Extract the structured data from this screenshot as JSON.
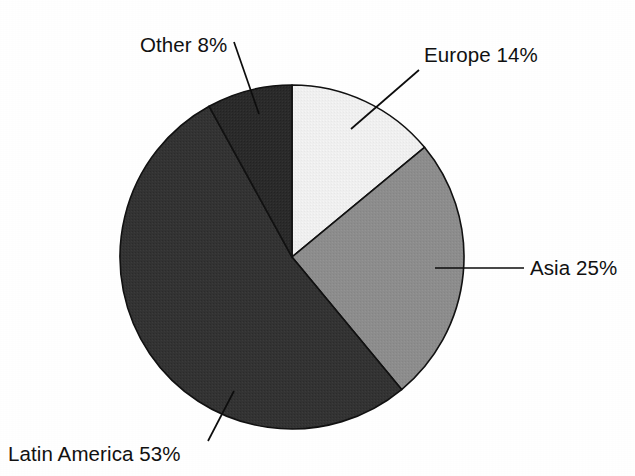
{
  "chart_data": {
    "type": "pie",
    "title": "",
    "subtitle": "",
    "xlabel": "",
    "ylabel": "",
    "legend_position": "none",
    "labels_position": "outside-with-leader-lines",
    "grid": false,
    "background_color": "#ffffff",
    "start_angle_deg": 0,
    "direction": "clockwise",
    "categories": [
      "Europe",
      "Asia",
      "Latin America",
      "Other"
    ],
    "values": [
      14,
      25,
      53,
      8
    ],
    "unit": "%",
    "slices": [
      {
        "name": "Europe",
        "value": 14,
        "label": "Europe 14%",
        "color": "#f0f0f0",
        "start_deg": 0,
        "end_deg": 50.4,
        "label_x": 424,
        "label_y": 62,
        "label_anchor": "start",
        "leader": {
          "x1": 351,
          "y1": 129,
          "x2": 419,
          "y2": 70
        }
      },
      {
        "name": "Asia",
        "value": 25,
        "label": "Asia 25%",
        "color": "#8d8d8d",
        "start_deg": 50.4,
        "end_deg": 140.4,
        "label_x": 530,
        "label_y": 275,
        "label_anchor": "start",
        "leader": {
          "x1": 435,
          "y1": 268,
          "x2": 524,
          "y2": 268
        }
      },
      {
        "name": "Latin America",
        "value": 53,
        "label": "Latin America 53%",
        "color": "#333333",
        "start_deg": 140.4,
        "end_deg": 331.2,
        "label_x": 8,
        "label_y": 461,
        "label_anchor": "start",
        "leader": {
          "x1": 234,
          "y1": 391,
          "x2": 208,
          "y2": 441
        }
      },
      {
        "name": "Other",
        "value": 8,
        "label": "Other 8%",
        "color": "#2a2a2a",
        "start_deg": 331.2,
        "end_deg": 360,
        "label_x": 140,
        "label_y": 52,
        "label_anchor": "start",
        "leader": {
          "x1": 234,
          "y1": 42,
          "x2": 259,
          "y2": 114
        }
      }
    ],
    "geometry": {
      "center_x": 292,
      "center_y": 257,
      "radius": 172
    }
  }
}
